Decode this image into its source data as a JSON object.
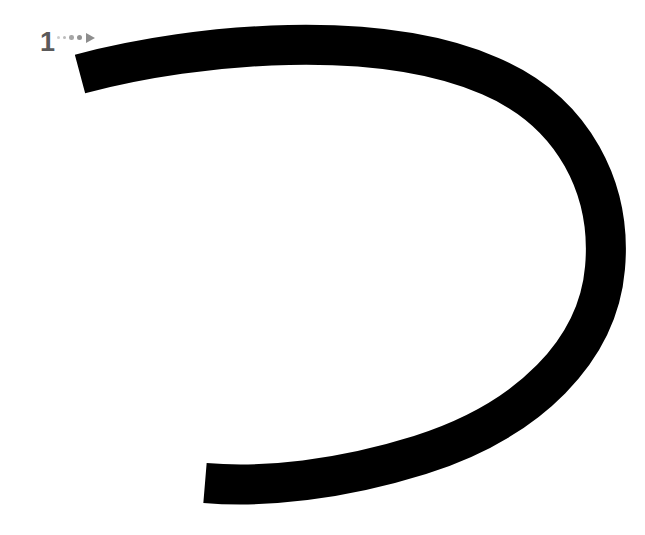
{
  "canvas": {
    "width": 645,
    "height": 535,
    "background_color": "#ffffff",
    "description": "gesture-stroke-annotation"
  },
  "stroke": {
    "label": "drawn-stroke",
    "color": "#000000",
    "width_px": 40,
    "linecap": "butt",
    "linejoin": "round",
    "shape": "horseshoe-d-curve",
    "path": "M 80 74 C 200 42, 380 28, 490 76 C 575 112, 612 190, 605 268 C 598 350, 530 420, 420 455 C 340 480, 265 488, 205 483",
    "start_point": [
      80,
      74
    ],
    "end_point": [
      205,
      483
    ]
  },
  "marker": {
    "step_number": "1",
    "color": "#5a5a5a",
    "trail_color": "#8d8d8d",
    "position": [
      40,
      30
    ],
    "dots": [
      "dot-1",
      "dot-2",
      "dot-3",
      "dot-4"
    ],
    "arrow": "arrow-head-right",
    "direction": "right"
  }
}
